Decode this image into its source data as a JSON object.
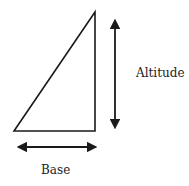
{
  "diagram": {
    "type": "right-triangle",
    "labels": {
      "altitude": "Altitude",
      "base": "Base"
    },
    "colors": {
      "stroke": "#1a1a1a",
      "text": "#222222",
      "background": "#ffffff"
    }
  }
}
